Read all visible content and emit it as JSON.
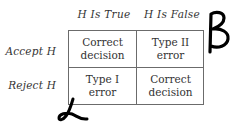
{
  "diagram": {
    "type": "decision-error-matrix",
    "column_headers": [
      "H Is True",
      "H Is False"
    ],
    "row_headers": [
      "Accept H",
      "Reject H"
    ],
    "cells": [
      [
        {
          "line1": "Correct",
          "line2": "decision"
        },
        {
          "line1": "Type II",
          "line2": "error"
        }
      ],
      [
        {
          "line1": "Type I",
          "line2": "error"
        },
        {
          "line1": "Correct",
          "line2": "decision"
        }
      ]
    ],
    "annotations": {
      "beta": {
        "symbol": "β",
        "description": "handwritten beta next to Type II error"
      },
      "alpha": {
        "symbol": "α",
        "description": "handwritten alpha below Type I error"
      }
    },
    "colors": {
      "line": "#6b6b6b",
      "text": "#333333",
      "ink": "#000000"
    }
  }
}
